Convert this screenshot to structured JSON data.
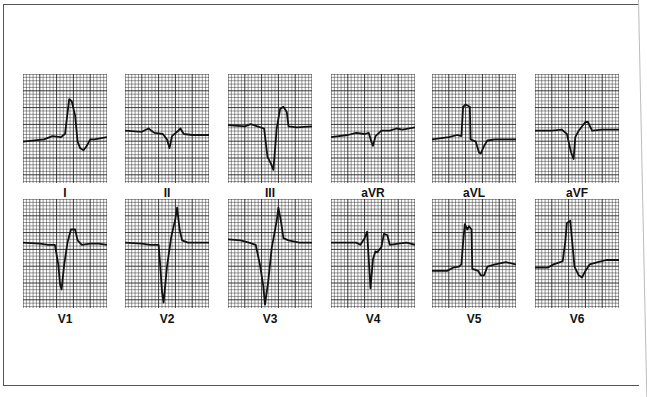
{
  "figure": {
    "grid_color": "#222222",
    "trace_color": "#111111",
    "background": "#ffffff"
  },
  "leads": [
    {
      "label": "I",
      "row": 0,
      "col": 0,
      "trace": [
        [
          0,
          0.62
        ],
        [
          0.25,
          0.6
        ],
        [
          0.35,
          0.57
        ],
        [
          0.45,
          0.58
        ],
        [
          0.5,
          0.55
        ],
        [
          0.55,
          0.23
        ],
        [
          0.58,
          0.25
        ],
        [
          0.62,
          0.38
        ],
        [
          0.65,
          0.62
        ],
        [
          0.68,
          0.68
        ],
        [
          0.72,
          0.7
        ],
        [
          0.76,
          0.66
        ],
        [
          0.8,
          0.6
        ],
        [
          0.85,
          0.6
        ],
        [
          1,
          0.58
        ]
      ]
    },
    {
      "label": "II",
      "row": 0,
      "col": 1,
      "trace": [
        [
          0,
          0.52
        ],
        [
          0.2,
          0.53
        ],
        [
          0.28,
          0.5
        ],
        [
          0.35,
          0.54
        ],
        [
          0.45,
          0.55
        ],
        [
          0.5,
          0.6
        ],
        [
          0.53,
          0.68
        ],
        [
          0.56,
          0.57
        ],
        [
          0.62,
          0.53
        ],
        [
          0.66,
          0.5
        ],
        [
          0.7,
          0.55
        ],
        [
          0.8,
          0.56
        ],
        [
          1,
          0.56
        ]
      ]
    },
    {
      "label": "III",
      "row": 0,
      "col": 2,
      "trace": [
        [
          0,
          0.47
        ],
        [
          0.2,
          0.48
        ],
        [
          0.27,
          0.46
        ],
        [
          0.35,
          0.48
        ],
        [
          0.43,
          0.5
        ],
        [
          0.47,
          0.76
        ],
        [
          0.51,
          0.82
        ],
        [
          0.54,
          0.88
        ],
        [
          0.58,
          0.5
        ],
        [
          0.62,
          0.32
        ],
        [
          0.66,
          0.3
        ],
        [
          0.7,
          0.35
        ],
        [
          0.72,
          0.48
        ],
        [
          0.82,
          0.49
        ],
        [
          1,
          0.48
        ]
      ]
    },
    {
      "label": "aVR",
      "row": 0,
      "col": 3,
      "trace": [
        [
          0,
          0.58
        ],
        [
          0.2,
          0.56
        ],
        [
          0.3,
          0.54
        ],
        [
          0.4,
          0.55
        ],
        [
          0.45,
          0.54
        ],
        [
          0.48,
          0.62
        ],
        [
          0.5,
          0.66
        ],
        [
          0.53,
          0.57
        ],
        [
          0.6,
          0.52
        ],
        [
          0.7,
          0.52
        ],
        [
          0.78,
          0.5
        ],
        [
          0.85,
          0.51
        ],
        [
          1,
          0.49
        ]
      ]
    },
    {
      "label": "aVL",
      "row": 0,
      "col": 4,
      "trace": [
        [
          0,
          0.6
        ],
        [
          0.2,
          0.58
        ],
        [
          0.3,
          0.56
        ],
        [
          0.35,
          0.57
        ],
        [
          0.37,
          0.3
        ],
        [
          0.4,
          0.28
        ],
        [
          0.45,
          0.3
        ],
        [
          0.46,
          0.6
        ],
        [
          0.52,
          0.62
        ],
        [
          0.56,
          0.72
        ],
        [
          0.58,
          0.73
        ],
        [
          0.62,
          0.66
        ],
        [
          0.66,
          0.61
        ],
        [
          0.75,
          0.6
        ],
        [
          0.85,
          0.6
        ],
        [
          1,
          0.6
        ]
      ]
    },
    {
      "label": "aVF",
      "row": 0,
      "col": 5,
      "trace": [
        [
          0,
          0.52
        ],
        [
          0.2,
          0.52
        ],
        [
          0.32,
          0.51
        ],
        [
          0.38,
          0.55
        ],
        [
          0.4,
          0.62
        ],
        [
          0.43,
          0.72
        ],
        [
          0.46,
          0.78
        ],
        [
          0.48,
          0.58
        ],
        [
          0.52,
          0.52
        ],
        [
          0.6,
          0.44
        ],
        [
          0.63,
          0.44
        ],
        [
          0.68,
          0.52
        ],
        [
          0.8,
          0.51
        ],
        [
          1,
          0.51
        ]
      ]
    },
    {
      "label": "V1",
      "row": 1,
      "col": 0,
      "trace": [
        [
          0,
          0.4
        ],
        [
          0.2,
          0.41
        ],
        [
          0.3,
          0.42
        ],
        [
          0.38,
          0.42
        ],
        [
          0.42,
          0.6
        ],
        [
          0.44,
          0.78
        ],
        [
          0.46,
          0.83
        ],
        [
          0.49,
          0.6
        ],
        [
          0.53,
          0.4
        ],
        [
          0.57,
          0.28
        ],
        [
          0.62,
          0.28
        ],
        [
          0.65,
          0.38
        ],
        [
          0.7,
          0.42
        ],
        [
          0.8,
          0.41
        ],
        [
          0.9,
          0.41
        ],
        [
          1,
          0.42
        ]
      ]
    },
    {
      "label": "V2",
      "row": 1,
      "col": 1,
      "trace": [
        [
          0,
          0.4
        ],
        [
          0.2,
          0.41
        ],
        [
          0.3,
          0.42
        ],
        [
          0.4,
          0.42
        ],
        [
          0.42,
          0.62
        ],
        [
          0.44,
          0.85
        ],
        [
          0.46,
          0.95
        ],
        [
          0.5,
          0.62
        ],
        [
          0.55,
          0.35
        ],
        [
          0.6,
          0.18
        ],
        [
          0.62,
          0.08
        ],
        [
          0.65,
          0.28
        ],
        [
          0.68,
          0.38
        ],
        [
          0.75,
          0.4
        ],
        [
          1,
          0.4
        ]
      ]
    },
    {
      "label": "V3",
      "row": 1,
      "col": 2,
      "trace": [
        [
          0,
          0.37
        ],
        [
          0.15,
          0.38
        ],
        [
          0.25,
          0.4
        ],
        [
          0.33,
          0.42
        ],
        [
          0.38,
          0.6
        ],
        [
          0.42,
          0.8
        ],
        [
          0.44,
          0.97
        ],
        [
          0.48,
          0.75
        ],
        [
          0.52,
          0.45
        ],
        [
          0.58,
          0.2
        ],
        [
          0.6,
          0.08
        ],
        [
          0.63,
          0.2
        ],
        [
          0.66,
          0.36
        ],
        [
          0.72,
          0.38
        ],
        [
          0.85,
          0.4
        ],
        [
          1,
          0.4
        ]
      ]
    },
    {
      "label": "V4",
      "row": 1,
      "col": 3,
      "trace": [
        [
          0,
          0.4
        ],
        [
          0.2,
          0.4
        ],
        [
          0.3,
          0.4
        ],
        [
          0.35,
          0.42
        ],
        [
          0.4,
          0.36
        ],
        [
          0.43,
          0.3
        ],
        [
          0.47,
          0.82
        ],
        [
          0.5,
          0.55
        ],
        [
          0.53,
          0.48
        ],
        [
          0.55,
          0.49
        ],
        [
          0.6,
          0.44
        ],
        [
          0.63,
          0.32
        ],
        [
          0.67,
          0.33
        ],
        [
          0.7,
          0.42
        ],
        [
          0.8,
          0.41
        ],
        [
          0.9,
          0.4
        ],
        [
          1,
          0.42
        ]
      ]
    },
    {
      "label": "V5",
      "row": 1,
      "col": 4,
      "trace": [
        [
          0,
          0.66
        ],
        [
          0.18,
          0.66
        ],
        [
          0.25,
          0.63
        ],
        [
          0.32,
          0.62
        ],
        [
          0.35,
          0.6
        ],
        [
          0.37,
          0.4
        ],
        [
          0.39,
          0.23
        ],
        [
          0.42,
          0.28
        ],
        [
          0.44,
          0.25
        ],
        [
          0.47,
          0.28
        ],
        [
          0.48,
          0.64
        ],
        [
          0.55,
          0.66
        ],
        [
          0.58,
          0.7
        ],
        [
          0.62,
          0.7
        ],
        [
          0.66,
          0.62
        ],
        [
          0.75,
          0.6
        ],
        [
          0.88,
          0.58
        ],
        [
          1,
          0.6
        ]
      ]
    },
    {
      "label": "V6",
      "row": 1,
      "col": 5,
      "trace": [
        [
          0,
          0.63
        ],
        [
          0.15,
          0.63
        ],
        [
          0.22,
          0.6
        ],
        [
          0.3,
          0.58
        ],
        [
          0.33,
          0.57
        ],
        [
          0.36,
          0.4
        ],
        [
          0.38,
          0.22
        ],
        [
          0.42,
          0.2
        ],
        [
          0.45,
          0.45
        ],
        [
          0.47,
          0.62
        ],
        [
          0.52,
          0.7
        ],
        [
          0.56,
          0.72
        ],
        [
          0.6,
          0.66
        ],
        [
          0.65,
          0.6
        ],
        [
          0.75,
          0.58
        ],
        [
          0.85,
          0.56
        ],
        [
          1,
          0.56
        ]
      ]
    }
  ]
}
